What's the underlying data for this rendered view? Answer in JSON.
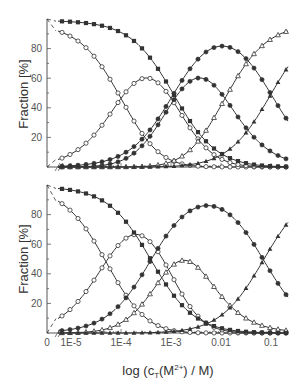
{
  "chart_data": [
    {
      "type": "line",
      "panel": "top",
      "title": "",
      "xlabel": "log (c_T(M2+) / M)",
      "ylabel": "Fraction [%]",
      "xscale": "log",
      "xlim": [
        5.5e-06,
        0.22
      ],
      "ylim": [
        0,
        100
      ],
      "x_tick_labels": [
        "0",
        "1E-5",
        "1E-4",
        "1E-3",
        "0.01",
        "0.1"
      ],
      "y_tick_labels": [
        "20",
        "40",
        "60",
        "80"
      ],
      "grid": false,
      "legend": null,
      "series": [
        {
          "name": "open-circles-descending",
          "marker": "open-circle",
          "peak_approx": 97,
          "fifty_percent_at_log": -4.0
        },
        {
          "name": "open-circles-rising",
          "marker": "open-circle",
          "peak_percent": 87,
          "peak_at": "~3E-4"
        },
        {
          "name": "filled-circles",
          "marker": "filled-circle",
          "peak_percent": 88,
          "peak_at": "~3.5E-3"
        },
        {
          "name": "open-triangles",
          "marker": "open-triangle",
          "end_percent": 94
        },
        {
          "name": "filled-squares",
          "marker": "filled-square",
          "start_percent": 98,
          "fifty_percent_at_log": -2.96
        },
        {
          "name": "filled-circles-2",
          "marker": "filled-circle",
          "peak_percent": 88
        },
        {
          "name": "filled-triangles",
          "marker": "filled-triangle",
          "end_percent": 57
        }
      ]
    },
    {
      "type": "line",
      "panel": "bottom",
      "title": "",
      "xlabel": "log (c_T(M2+) / M)",
      "ylabel": "Fraction [%]",
      "xscale": "log",
      "xlim": [
        5.5e-06,
        0.22
      ],
      "ylim": [
        0,
        100
      ],
      "x_tick_labels": [
        "0",
        "1E-5",
        "1E-4",
        "1E-3",
        "0.01",
        "0.1"
      ],
      "y_tick_labels": [
        "20",
        "40",
        "60",
        "80"
      ],
      "grid": false,
      "legend": null,
      "series": [
        {
          "name": "open-circles-descending",
          "marker": "open-circle",
          "fifty_percent_at_log": -4.3
        },
        {
          "name": "open-circles-rising",
          "marker": "open-circle",
          "peak_percent": 87,
          "peak_at": "~2E-4"
        },
        {
          "name": "filled-circles",
          "marker": "filled-circle",
          "peak_percent": 78,
          "peak_at": "~0.02"
        },
        {
          "name": "open-triangles",
          "marker": "open-triangle",
          "end_percent": 95
        },
        {
          "name": "filled-squares",
          "marker": "filled-square",
          "start_percent": 98
        },
        {
          "name": "filled-triangles",
          "marker": "filled-triangle",
          "end_percent": 66
        }
      ]
    }
  ],
  "axes": {
    "ylabel": "Fraction [%]",
    "xlabel_prefix": "log (c",
    "xlabel_sub": "T",
    "xlabel_mid": "(M",
    "xlabel_sup": "2+",
    "xlabel_suffix": ") / M)",
    "x_ticks": [
      {
        "label": "0",
        "x": 47
      },
      {
        "label": "1E-5",
        "x": 71
      },
      {
        "label": "1E-4",
        "x": 121
      },
      {
        "label": "1E-3",
        "x": 171
      },
      {
        "label": "0.01",
        "x": 221
      },
      {
        "label": "0.1",
        "x": 271
      }
    ],
    "y_ticks": [
      "20",
      "40",
      "60",
      "80"
    ]
  },
  "models": {
    "top": {
      "systemA": {
        "logK": [
          4.0,
          2.96,
          1.92
        ],
        "markers": [
          "open-circle",
          "open-circle",
          "filled-circle",
          "open-triangle"
        ],
        "scale": 0.97
      },
      "systemB": {
        "logK": [
          2.95,
          1.0
        ],
        "markers": [
          "filled-square",
          "filled-circle",
          "filled-triangle"
        ],
        "scale": 0.99
      }
    },
    "bottom": {
      "systemA": {
        "logK": [
          4.3,
          3.05,
          2.45
        ],
        "markers": [
          "open-circle",
          "open-circle",
          "open-triangle",
          "none"
        ],
        "scale": 0.99
      },
      "systemB": {
        "logK": [
          3.4,
          1.15
        ],
        "markers": [
          "filled-square",
          "filled-circle",
          "filled-triangle"
        ],
        "scale": 0.99
      }
    }
  },
  "colors": {
    "line": "#333333",
    "axis": "#555555",
    "text": "#444444"
  }
}
